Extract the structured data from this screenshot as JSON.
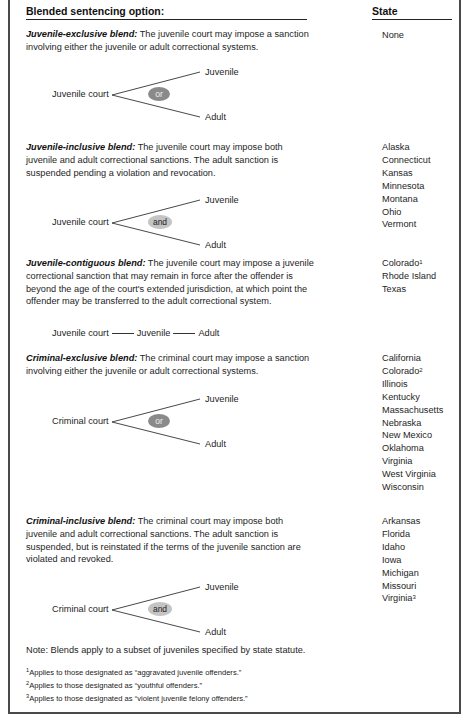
{
  "table": {
    "header_left": "Blended sentencing option:",
    "header_right": "State",
    "rows": [
      {
        "title": "Juvenile-exclusive blend:",
        "text": " The juvenile court may impose a sanction involving either the juvenile or adult correctional systems.",
        "diagram": {
          "court": "Juvenile court",
          "connector": "or",
          "top": "Juvenile",
          "bottom": "Adult"
        },
        "states": [
          {
            "name": "None",
            "note": ""
          }
        ]
      },
      {
        "title": "Juvenile-inclusive blend:",
        "text": " The juvenile court may impose both juvenile and adult correctional sanctions. The adult sanction is suspended pending a violation and revocation.",
        "diagram": {
          "court": "Juvenile court",
          "connector": "and",
          "top": "Juvenile",
          "bottom": "Adult"
        },
        "states": [
          {
            "name": "Alaska",
            "note": ""
          },
          {
            "name": "Connecticut",
            "note": ""
          },
          {
            "name": "Kansas",
            "note": ""
          },
          {
            "name": "Minnesota",
            "note": ""
          },
          {
            "name": "Montana",
            "note": ""
          },
          {
            "name": "Ohio",
            "note": ""
          },
          {
            "name": "Vermont",
            "note": ""
          }
        ]
      },
      {
        "title": "Juvenile-contiguous blend:",
        "text": " The juvenile court may impose a juvenile correctional sanction that may remain in force after the offender is beyond the age of the court's extended jurisdiction, at which point the offender may be transferred to the adult correctional system.",
        "diagram": {
          "court": "Juvenile court",
          "middle": "Juvenile",
          "end": "Adult"
        },
        "states": [
          {
            "name": "Colorado",
            "note": "1"
          },
          {
            "name": "Rhode Island",
            "note": ""
          },
          {
            "name": "Texas",
            "note": ""
          }
        ]
      },
      {
        "title": "Criminal-exclusive blend:",
        "text": " The criminal court may impose a sanction involving either the juvenile or adult correctional systems.",
        "diagram": {
          "court": "Criminal court",
          "connector": "or",
          "top": "Juvenile",
          "bottom": "Adult"
        },
        "states": [
          {
            "name": "California",
            "note": ""
          },
          {
            "name": "Colorado",
            "note": "2"
          },
          {
            "name": "Illinois",
            "note": ""
          },
          {
            "name": "Kentucky",
            "note": ""
          },
          {
            "name": "Massachusetts",
            "note": ""
          },
          {
            "name": "Nebraska",
            "note": ""
          },
          {
            "name": "New Mexico",
            "note": ""
          },
          {
            "name": "Oklahoma",
            "note": ""
          },
          {
            "name": "Virginia",
            "note": ""
          },
          {
            "name": "West Virginia",
            "note": ""
          },
          {
            "name": "Wisconsin",
            "note": ""
          }
        ]
      },
      {
        "title": "Criminal-inclusive blend:",
        "text": " The criminal court may impose both juvenile and adult correctional sanctions. The adult sanction is suspended, but is reinstated if the terms of the juvenile sanction are violated and revoked.",
        "diagram": {
          "court": "Criminal court",
          "connector": "and",
          "top": "Juvenile",
          "bottom": "Adult"
        },
        "states": [
          {
            "name": "Arkansas",
            "note": ""
          },
          {
            "name": "Florida",
            "note": ""
          },
          {
            "name": "Idaho",
            "note": ""
          },
          {
            "name": "Iowa",
            "note": ""
          },
          {
            "name": "Michigan",
            "note": ""
          },
          {
            "name": "Missouri",
            "note": ""
          },
          {
            "name": "Virginia",
            "note": "3"
          }
        ]
      }
    ]
  },
  "note": "Note: Blends apply to a subset of juveniles specified by state statute.",
  "footnotes": [
    {
      "mark": "1",
      "text": "Applies to those designated as “aggravated juvenile offenders.”"
    },
    {
      "mark": "2",
      "text": "Applies to those designated as “youthful offenders.”"
    },
    {
      "mark": "3",
      "text": "Applies to those designated as “violent juvenile felony offenders.”"
    }
  ],
  "colors": {
    "or_oval": "#8a8a8a",
    "and_oval": "#c4c4c4",
    "border": "#4a4a4a"
  }
}
